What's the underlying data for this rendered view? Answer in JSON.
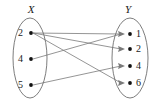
{
  "figure": {
    "type": "mapping-diagram",
    "width": 158,
    "height": 103,
    "background_color": "#ffffff",
    "line_color": "#7a7a7a",
    "ellipse_color": "#6e6e6e",
    "dot_color": "#111111",
    "text_color": "#1a1a1a"
  },
  "sets": {
    "left": {
      "label": "X",
      "label_x": 31,
      "label_y": 13,
      "ellipse": {
        "cx": 30,
        "cy": 58,
        "rx": 17,
        "ry": 40
      },
      "elements": [
        {
          "value": "2",
          "label_x": 20,
          "label_y": 36,
          "dot_x": 31,
          "dot_y": 33
        },
        {
          "value": "4",
          "label_x": 20,
          "label_y": 62,
          "dot_x": 31,
          "dot_y": 59
        },
        {
          "value": "5",
          "label_x": 20,
          "label_y": 88,
          "dot_x": 31,
          "dot_y": 85
        }
      ]
    },
    "right": {
      "label": "Y",
      "label_x": 128,
      "label_y": 13,
      "ellipse": {
        "cx": 130,
        "cy": 58,
        "rx": 18,
        "ry": 40
      },
      "elements": [
        {
          "value": "1",
          "label_x": 138,
          "label_y": 37,
          "dot_x": 130,
          "dot_y": 34
        },
        {
          "value": "2",
          "label_x": 138,
          "label_y": 52,
          "dot_x": 130,
          "dot_y": 49
        },
        {
          "value": "4",
          "label_x": 138,
          "label_y": 69,
          "dot_x": 130,
          "dot_y": 66
        },
        {
          "value": "6",
          "label_x": 138,
          "label_y": 86,
          "dot_x": 130,
          "dot_y": 83
        }
      ]
    }
  },
  "edges": [
    {
      "from": "2",
      "to": "1",
      "x1": 33,
      "y1": 33,
      "x2": 121,
      "y2": 34
    },
    {
      "from": "2",
      "to": "2",
      "x1": 33,
      "y1": 33,
      "x2": 121,
      "y2": 49
    },
    {
      "from": "2",
      "to": "6",
      "x1": 33,
      "y1": 33,
      "x2": 121,
      "y2": 83
    },
    {
      "from": "4",
      "to": "1",
      "x1": 33,
      "y1": 59,
      "x2": 121,
      "y2": 34
    },
    {
      "from": "5",
      "to": "4",
      "x1": 33,
      "y1": 85,
      "x2": 121,
      "y2": 66
    }
  ],
  "arrowheads": [
    {
      "at": "1",
      "x": 121,
      "y": 34
    },
    {
      "at": "2",
      "x": 121,
      "y": 49
    },
    {
      "at": "4",
      "x": 121,
      "y": 66
    },
    {
      "at": "6",
      "x": 121,
      "y": 83
    }
  ]
}
